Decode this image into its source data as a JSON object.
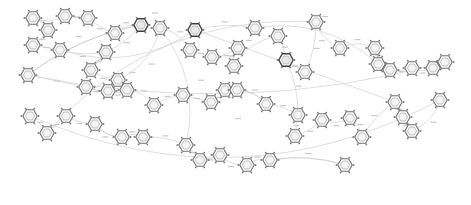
{
  "diagram": {
    "type": "network-graph",
    "node_glyph": "hexagon-ring-icon",
    "colors": {
      "background": "#ffffff",
      "node_stroke": "#6f6f6f",
      "node_stroke_dark": "#3f3f3f",
      "edge_stroke": "#d6d6d6",
      "label_text": "#8a8a8a"
    },
    "nodes": [
      {
        "id": "n1",
        "label": "",
        "style": "light"
      },
      {
        "id": "n2",
        "label": "",
        "style": "light"
      },
      {
        "id": "n3",
        "label": "",
        "style": "light"
      },
      {
        "id": "n4",
        "label": "",
        "style": "light"
      },
      {
        "id": "n5",
        "label": "",
        "style": "light"
      },
      {
        "id": "n6",
        "label": "",
        "style": "light"
      },
      {
        "id": "n7",
        "label": "",
        "style": "light"
      },
      {
        "id": "n8",
        "label": "",
        "style": "dark"
      },
      {
        "id": "n9",
        "label": "",
        "style": "light"
      },
      {
        "id": "n10",
        "label": "",
        "style": "light"
      },
      {
        "id": "n11",
        "label": "",
        "style": "light"
      },
      {
        "id": "n12",
        "label": "",
        "style": "light"
      },
      {
        "id": "n13",
        "label": "",
        "style": "dark"
      },
      {
        "id": "n14",
        "label": "",
        "style": "light"
      },
      {
        "id": "n15",
        "label": "",
        "style": "light"
      },
      {
        "id": "n16",
        "label": "",
        "style": "light"
      },
      {
        "id": "n17",
        "label": "",
        "style": "light"
      },
      {
        "id": "n18",
        "label": "",
        "style": "light"
      },
      {
        "id": "n19",
        "label": "",
        "style": "light"
      },
      {
        "id": "n20",
        "label": "",
        "style": "dark"
      },
      {
        "id": "n21",
        "label": "",
        "style": "light"
      },
      {
        "id": "n22",
        "label": "",
        "style": "light"
      },
      {
        "id": "n23",
        "label": "",
        "style": "light"
      },
      {
        "id": "n24",
        "label": "",
        "style": "light"
      },
      {
        "id": "n25",
        "label": "",
        "style": "light"
      },
      {
        "id": "n26",
        "label": "",
        "style": "light"
      },
      {
        "id": "n27",
        "label": "",
        "style": "light"
      },
      {
        "id": "n28",
        "label": "",
        "style": "light"
      },
      {
        "id": "n29",
        "label": "",
        "style": "light"
      },
      {
        "id": "n30",
        "label": "",
        "style": "light"
      },
      {
        "id": "n31",
        "label": "",
        "style": "light"
      },
      {
        "id": "n32",
        "label": "",
        "style": "light"
      },
      {
        "id": "n33",
        "label": "",
        "style": "light"
      },
      {
        "id": "n34",
        "label": "",
        "style": "light"
      },
      {
        "id": "n35",
        "label": "",
        "style": "light"
      },
      {
        "id": "n36",
        "label": "",
        "style": "light"
      },
      {
        "id": "n37",
        "label": "",
        "style": "light"
      },
      {
        "id": "n38",
        "label": "",
        "style": "light"
      },
      {
        "id": "n39",
        "label": "",
        "style": "light"
      },
      {
        "id": "n40",
        "label": "",
        "style": "light"
      },
      {
        "id": "n41",
        "label": "",
        "style": "light"
      },
      {
        "id": "n42",
        "label": "",
        "style": "light"
      },
      {
        "id": "n43",
        "label": "",
        "style": "light"
      },
      {
        "id": "n44",
        "label": "",
        "style": "light"
      },
      {
        "id": "n45",
        "label": "",
        "style": "light"
      },
      {
        "id": "n46",
        "label": "",
        "style": "light"
      },
      {
        "id": "n47",
        "label": "",
        "style": "light"
      },
      {
        "id": "n48",
        "label": "",
        "style": "light"
      },
      {
        "id": "n49",
        "label": "",
        "style": "light"
      },
      {
        "id": "n50",
        "label": "",
        "style": "light"
      },
      {
        "id": "n51",
        "label": "",
        "style": "light"
      },
      {
        "id": "n52",
        "label": "",
        "style": "light"
      },
      {
        "id": "n53",
        "label": "",
        "style": "light"
      },
      {
        "id": "n54",
        "label": "",
        "style": "light"
      },
      {
        "id": "n55",
        "label": "",
        "style": "light"
      },
      {
        "id": "n56",
        "label": "",
        "style": "light"
      },
      {
        "id": "n57",
        "label": "",
        "style": "light"
      },
      {
        "id": "n58",
        "label": "",
        "style": "light"
      },
      {
        "id": "n59",
        "label": "",
        "style": "light"
      },
      {
        "id": "n60",
        "label": "",
        "style": "light"
      }
    ],
    "edges": [
      {
        "from": "n1",
        "to": "n2",
        "label": ""
      },
      {
        "from": "n2",
        "to": "n5",
        "label": ""
      },
      {
        "from": "n5",
        "to": "n6",
        "label": ""
      },
      {
        "from": "n6",
        "to": "n9",
        "label": ""
      },
      {
        "from": "n6",
        "to": "n13",
        "label": ""
      },
      {
        "from": "n7",
        "to": "n8",
        "label": ""
      },
      {
        "from": "n8",
        "to": "n9",
        "label": ""
      },
      {
        "from": "n9",
        "to": "n10",
        "label": ""
      },
      {
        "from": "n10",
        "to": "n11",
        "label": ""
      },
      {
        "from": "n11",
        "to": "n12",
        "label": ""
      },
      {
        "from": "n12",
        "to": "n14",
        "label": ""
      },
      {
        "from": "n13",
        "to": "n16",
        "label": ""
      },
      {
        "from": "n14",
        "to": "n15",
        "label": ""
      },
      {
        "from": "n15",
        "to": "n17",
        "label": ""
      },
      {
        "from": "n17",
        "to": "n18",
        "label": ""
      },
      {
        "from": "n18",
        "to": "n19",
        "label": ""
      },
      {
        "from": "n19",
        "to": "n20",
        "label": ""
      },
      {
        "from": "n20",
        "to": "n21",
        "label": ""
      },
      {
        "from": "n21",
        "to": "n22",
        "label": ""
      },
      {
        "from": "n22",
        "to": "n23",
        "label": ""
      },
      {
        "from": "n23",
        "to": "n24",
        "label": ""
      },
      {
        "from": "n24",
        "to": "n25",
        "label": ""
      },
      {
        "from": "n25",
        "to": "n26",
        "label": ""
      },
      {
        "from": "n26",
        "to": "n27",
        "label": ""
      },
      {
        "from": "n27",
        "to": "n28",
        "label": ""
      },
      {
        "from": "n28",
        "to": "n29",
        "label": ""
      },
      {
        "from": "n29",
        "to": "n30",
        "label": ""
      },
      {
        "from": "n30",
        "to": "n31",
        "label": ""
      },
      {
        "from": "n31",
        "to": "n32",
        "label": ""
      },
      {
        "from": "n32",
        "to": "n33",
        "label": ""
      },
      {
        "from": "n33",
        "to": "n34",
        "label": ""
      },
      {
        "from": "n34",
        "to": "n35",
        "label": ""
      },
      {
        "from": "n35",
        "to": "n36",
        "label": ""
      },
      {
        "from": "n36",
        "to": "n37",
        "label": ""
      },
      {
        "from": "n37",
        "to": "n38",
        "label": ""
      },
      {
        "from": "n38",
        "to": "n39",
        "label": ""
      },
      {
        "from": "n39",
        "to": "n40",
        "label": ""
      },
      {
        "from": "n40",
        "to": "n41",
        "label": ""
      },
      {
        "from": "n41",
        "to": "n42",
        "label": ""
      },
      {
        "from": "n42",
        "to": "n43",
        "label": ""
      },
      {
        "from": "n43",
        "to": "n44",
        "label": ""
      },
      {
        "from": "n44",
        "to": "n45",
        "label": ""
      },
      {
        "from": "n45",
        "to": "n46",
        "label": ""
      },
      {
        "from": "n46",
        "to": "n47",
        "label": ""
      },
      {
        "from": "n47",
        "to": "n48",
        "label": ""
      },
      {
        "from": "n48",
        "to": "n49",
        "label": ""
      },
      {
        "from": "n49",
        "to": "n50",
        "label": ""
      },
      {
        "from": "n50",
        "to": "n51",
        "label": ""
      },
      {
        "from": "n51",
        "to": "n52",
        "label": ""
      },
      {
        "from": "n52",
        "to": "n53",
        "label": ""
      },
      {
        "from": "n53",
        "to": "n54",
        "label": ""
      },
      {
        "from": "n54",
        "to": "n55",
        "label": ""
      },
      {
        "from": "n55",
        "to": "n56",
        "label": ""
      },
      {
        "from": "n56",
        "to": "n57",
        "label": ""
      },
      {
        "from": "n57",
        "to": "n58",
        "label": ""
      },
      {
        "from": "n58",
        "to": "n59",
        "label": ""
      },
      {
        "from": "n59",
        "to": "n60",
        "label": ""
      },
      {
        "from": "n3",
        "to": "n4",
        "label": ""
      },
      {
        "from": "n4",
        "to": "n7",
        "label": ""
      },
      {
        "from": "n1",
        "to": "n3",
        "label": ""
      },
      {
        "from": "n16",
        "to": "n25",
        "label": ""
      },
      {
        "from": "n20",
        "to": "n40",
        "label": ""
      },
      {
        "from": "n13",
        "to": "n45",
        "label": ""
      },
      {
        "from": "n8",
        "to": "n30",
        "label": ""
      },
      {
        "from": "n22",
        "to": "n50",
        "label": ""
      },
      {
        "from": "n12",
        "to": "n55",
        "label": ""
      }
    ]
  }
}
